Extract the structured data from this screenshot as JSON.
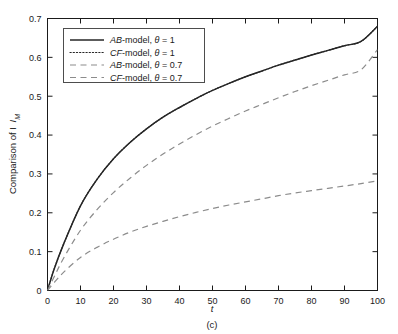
{
  "chart_data": {
    "type": "line",
    "title": "",
    "caption": "(c)",
    "xlabel": "t",
    "ylabel": "Comparison of I",
    "ylabel_subscript": "M",
    "xlim": [
      0,
      100
    ],
    "ylim": [
      0,
      0.7
    ],
    "xticks": [
      0,
      10,
      20,
      30,
      40,
      50,
      60,
      70,
      80,
      90,
      100
    ],
    "yticks": [
      "0",
      "0.1",
      "0.2",
      "0.3",
      "0.4",
      "0.5",
      "0.6",
      "0.7"
    ],
    "ytick_values": [
      0,
      0.1,
      0.2,
      0.3,
      0.4,
      0.5,
      0.6,
      0.7
    ],
    "grid": false,
    "legend_position": "upper-left-inside",
    "axis_color": "#1a1a1a",
    "background_color": "#ffffff",
    "x": [
      0,
      2,
      5,
      10,
      15,
      20,
      25,
      30,
      35,
      40,
      45,
      50,
      55,
      60,
      65,
      70,
      75,
      80,
      85,
      90,
      95,
      100
    ],
    "series": [
      {
        "name": "AB-model, θ = 1",
        "model": "AB",
        "theta": "1",
        "style": "solid",
        "color": "#262626",
        "values": [
          0,
          0.055,
          0.122,
          0.218,
          0.286,
          0.339,
          0.381,
          0.416,
          0.446,
          0.471,
          0.494,
          0.515,
          0.533,
          0.55,
          0.565,
          0.58,
          0.593,
          0.606,
          0.618,
          0.63,
          0.641,
          0.68
        ]
      },
      {
        "name": "CF-model, θ = 1",
        "model": "CF",
        "theta": "1",
        "style": "dotted",
        "color": "#262626",
        "values": [
          0,
          0.055,
          0.122,
          0.218,
          0.286,
          0.339,
          0.381,
          0.416,
          0.446,
          0.471,
          0.494,
          0.515,
          0.533,
          0.55,
          0.565,
          0.58,
          0.593,
          0.606,
          0.618,
          0.63,
          0.641,
          0.68
        ]
      },
      {
        "name": "AB-model, θ = 0.7",
        "model": "AB",
        "theta": "0.7",
        "style": "dashed",
        "color": "#8c8c8c",
        "values": [
          0,
          0.035,
          0.085,
          0.155,
          0.208,
          0.252,
          0.289,
          0.322,
          0.351,
          0.377,
          0.401,
          0.423,
          0.443,
          0.462,
          0.479,
          0.496,
          0.512,
          0.527,
          0.541,
          0.555,
          0.568,
          0.62
        ]
      },
      {
        "name": "CF-model, θ = 0.7",
        "model": "CF",
        "theta": "0.7",
        "style": "dashed",
        "color": "#8c8c8c",
        "values": [
          0,
          0.02,
          0.048,
          0.085,
          0.111,
          0.132,
          0.15,
          0.165,
          0.178,
          0.19,
          0.201,
          0.211,
          0.22,
          0.228,
          0.236,
          0.244,
          0.251,
          0.257,
          0.263,
          0.269,
          0.275,
          0.282
        ]
      }
    ],
    "legend_entries": [
      {
        "label_model": "AB",
        "label_rest": "-model, ",
        "theta_symbol": "θ",
        "eq": " = 1",
        "style": "solid"
      },
      {
        "label_model": "CF",
        "label_rest": "-model, ",
        "theta_symbol": "θ",
        "eq": " = 1",
        "style": "dotted"
      },
      {
        "label_model": "AB",
        "label_rest": "-model, ",
        "theta_symbol": "θ",
        "eq": " = 0.7",
        "style": "dashed"
      },
      {
        "label_model": "CF",
        "label_rest": "-model, ",
        "theta_symbol": "θ",
        "eq": " = 0.7",
        "style": "dashed"
      }
    ]
  }
}
